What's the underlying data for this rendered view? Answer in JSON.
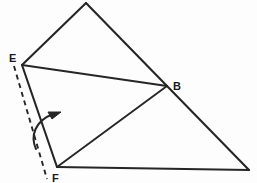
{
  "figure": {
    "background_color": "#fdfdfd",
    "stroke_color": "#262626",
    "label_color": "#1a1a1a",
    "canvas": {
      "width": 257,
      "height": 183
    }
  },
  "labels": {
    "e": "E",
    "b": "B",
    "f": "F"
  },
  "points": {
    "apex": {
      "name": "apex-vertex",
      "x": 86,
      "y": 3
    },
    "e": {
      "name": "vertex-e",
      "x": 22,
      "y": 65
    },
    "b": {
      "name": "vertex-b",
      "x": 167,
      "y": 86
    },
    "f": {
      "name": "vertex-f",
      "x": 57,
      "y": 167
    },
    "right": {
      "name": "right-vertex",
      "x": 249,
      "y": 170
    }
  },
  "label_positions": {
    "e": {
      "x": 9,
      "y": 62
    },
    "b": {
      "x": 173,
      "y": 87
    },
    "f": {
      "x": 52,
      "y": 181
    }
  },
  "edges": [
    {
      "name": "edge-e-apex",
      "from": "e",
      "to": "apex",
      "style": "solid"
    },
    {
      "name": "edge-apex-b",
      "from": "apex",
      "to": "b",
      "style": "solid"
    },
    {
      "name": "edge-b-right",
      "from": "b",
      "to": "right",
      "style": "solid"
    },
    {
      "name": "edge-right-f",
      "from": "right",
      "to": "f",
      "style": "solid"
    },
    {
      "name": "edge-f-e",
      "from": "f",
      "to": "e",
      "style": "solid"
    },
    {
      "name": "edge-e-b",
      "from": "e",
      "to": "b",
      "style": "solid"
    },
    {
      "name": "edge-f-b",
      "from": "f",
      "to": "b",
      "style": "solid"
    }
  ],
  "dashed_line": {
    "name": "fold-axis-dashed-line",
    "x1": 14,
    "y1": 66,
    "x2": 47,
    "y2": 179,
    "dash_pattern": "5,4"
  },
  "rotation_arrow": {
    "name": "rotation-arrow",
    "path": "M 36 149 C 31 136 35 122 52 115",
    "arrow_tip": {
      "x": 60,
      "y": 113
    },
    "direction": "counter-clockwise-up-right"
  }
}
